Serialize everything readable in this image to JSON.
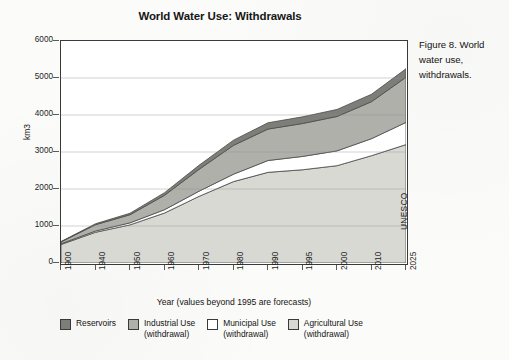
{
  "figure": {
    "caption": "Figure 8. World water use, withdrawals.",
    "source": "UNESCO"
  },
  "chart_data": {
    "type": "area",
    "stacked": true,
    "title": "World Water Use: Withdrawals",
    "xlabel": "Year (values beyond 1995 are forecasts)",
    "ylabel": "km3",
    "ylim": [
      0,
      6000
    ],
    "yticks": [
      0,
      1000,
      2000,
      3000,
      4000,
      5000,
      6000
    ],
    "grid": "horizontal",
    "legend_position": "bottom",
    "categories": [
      "1900",
      "1940",
      "1950",
      "1960",
      "1970",
      "1980",
      "1990",
      "1995",
      "2000",
      "2010",
      "2025"
    ],
    "x": [
      1900,
      1940,
      1950,
      1960,
      1970,
      1980,
      1990,
      1995,
      2000,
      2010,
      2025
    ],
    "series": [
      {
        "name": "Agricultural Use (withdrawal)",
        "color": "#d9d9d4",
        "values": [
          500,
          830,
          1030,
          1350,
          1800,
          2200,
          2450,
          2520,
          2630,
          2900,
          3200
        ]
      },
      {
        "name": "Municipal Use (withdrawal)",
        "color": "#ffffff",
        "values": [
          20,
          35,
          55,
          90,
          140,
          200,
          320,
          360,
          400,
          460,
          600
        ]
      },
      {
        "name": "Industrial Use (withdrawal)",
        "color": "#b0b0ab",
        "values": [
          50,
          170,
          220,
          390,
          590,
          780,
          850,
          890,
          930,
          1000,
          1220
        ]
      },
      {
        "name": "Reservoirs",
        "color": "#7e7e79",
        "values": [
          10,
          25,
          40,
          70,
          110,
          140,
          170,
          180,
          190,
          200,
          230
        ]
      }
    ],
    "totals": [
      580,
      1060,
      1345,
      1900,
      2640,
      3320,
      3790,
      3950,
      4150,
      4560,
      5250
    ],
    "annotations": [
      "values beyond 1995 are forecasts"
    ]
  },
  "legend": {
    "items": [
      {
        "label": "Reservoirs",
        "sub": "",
        "color": "#7e7e79"
      },
      {
        "label": "Industrial Use",
        "sub": "(withdrawal)",
        "color": "#b0b0ab"
      },
      {
        "label": "Municipal Use",
        "sub": "(withdrawal)",
        "color": "#ffffff"
      },
      {
        "label": "Agricultural Use",
        "sub": "(withdrawal)",
        "color": "#d9d9d4"
      }
    ]
  },
  "ytick_labels": [
    "6000",
    "5000",
    "4000",
    "3000",
    "2000",
    "1000",
    "0"
  ]
}
